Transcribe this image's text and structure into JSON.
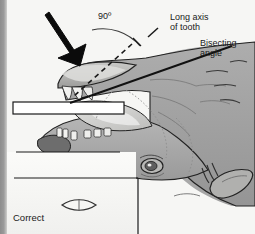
{
  "figure": {
    "background_color": "#f6f6f4",
    "head_fill_color": "#a0a0a0",
    "outline_color": "#1a1a1a",
    "film_color": "#ffffff"
  },
  "labels": {
    "angle_90": "90º",
    "long_axis": "Long axis\nof tooth",
    "bisecting_angle": "Bisecting\nangle",
    "correct": "Correct"
  },
  "annotations": {
    "beam_arrow": "thick black arrow indicating x-ray beam direction, perpendicular to the bisecting line",
    "dashed_line": "long axis of tooth (dashed)",
    "solid_line": "bisecting angle line (solid)",
    "arc": "90 degree arc between beam and bisecting line",
    "film_plate": "intraoral film / sensor plate positioned in the mouth",
    "result_symbol": "lens-shaped outline representing a correctly elongated-free radiographic image"
  },
  "anatomy": {
    "subject": "horse head, lateral view, mouth open",
    "parts": [
      "upper lip",
      "incisors",
      "lower jaw",
      "cheek",
      "eye",
      "ear",
      "muzzle",
      "table surface"
    ]
  }
}
